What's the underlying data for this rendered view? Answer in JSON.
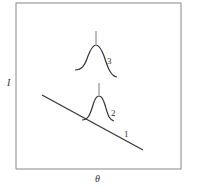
{
  "diagram": {
    "x_axis_label": "θ",
    "y_axis_label": "I",
    "curves": [
      {
        "id": "1",
        "label": "1",
        "kind": "decreasing line"
      },
      {
        "id": "2",
        "label": "2",
        "kind": "small peak on line"
      },
      {
        "id": "3",
        "label": "3",
        "kind": "isolated peak"
      }
    ],
    "colors": {
      "stroke": "#333333",
      "frame": "#888888"
    }
  }
}
